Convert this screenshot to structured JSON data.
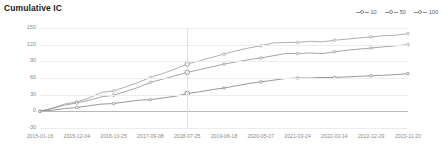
{
  "chart_data": {
    "type": "line",
    "title": "Cumulative IC",
    "xlabel": "",
    "ylabel": "",
    "ylim": [
      -30,
      150
    ],
    "yticks": [
      150,
      120,
      90,
      60,
      30,
      0,
      -30
    ],
    "grid": true,
    "legend_position": "top-right",
    "x_tick_labels": [
      "2015-01-16",
      "2015-12-04",
      "2016-10-25",
      "2017-09-08",
      "2018-07-25",
      "2019-06-18",
      "2020-05-07",
      "2021-03-24",
      "2022-03-14",
      "2022-12-29",
      "2023-11-20"
    ],
    "highlight_x": "2018-07-25",
    "x": [
      "2015-01-16",
      "2015-05-20",
      "2015-09-10",
      "2015-12-04",
      "2016-03-18",
      "2016-07-05",
      "2016-10-25",
      "2017-02-10",
      "2017-05-26",
      "2017-09-08",
      "2017-12-20",
      "2018-04-10",
      "2018-07-25",
      "2018-11-12",
      "2019-02-26",
      "2019-06-18",
      "2019-10-02",
      "2020-01-21",
      "2020-05-07",
      "2020-08-25",
      "2021-01-08",
      "2021-03-24",
      "2021-07-15",
      "2021-11-02",
      "2022-03-14",
      "2022-06-30",
      "2022-09-16",
      "2022-12-29",
      "2023-04-14",
      "2023-08-01",
      "2023-11-20"
    ],
    "series": [
      {
        "name": "100",
        "color": "#9a9a9a",
        "values": [
          0,
          6,
          13,
          17,
          24,
          34,
          37,
          44,
          52,
          61,
          68,
          76,
          85,
          91,
          97,
          103,
          109,
          114,
          118,
          123,
          124,
          124,
          126,
          125,
          128,
          130,
          132,
          134,
          136,
          137,
          140
        ]
      },
      {
        "name": "50",
        "color": "#8f8f8f",
        "values": [
          0,
          5,
          11,
          15,
          20,
          26,
          29,
          36,
          43,
          52,
          58,
          64,
          70,
          75,
          80,
          85,
          89,
          93,
          96,
          100,
          104,
          104,
          105,
          104,
          107,
          110,
          112,
          114,
          116,
          118,
          120
        ]
      },
      {
        "name": "10",
        "color": "#7d7d7d",
        "values": [
          0,
          2,
          5,
          7,
          10,
          13,
          14,
          17,
          20,
          21,
          24,
          27,
          32,
          35,
          39,
          42,
          46,
          50,
          53,
          56,
          59,
          60,
          60,
          61,
          61,
          62,
          63,
          64,
          65,
          66,
          68
        ]
      }
    ],
    "legend": [
      {
        "label": "10"
      },
      {
        "label": "50"
      },
      {
        "label": "100"
      }
    ]
  }
}
